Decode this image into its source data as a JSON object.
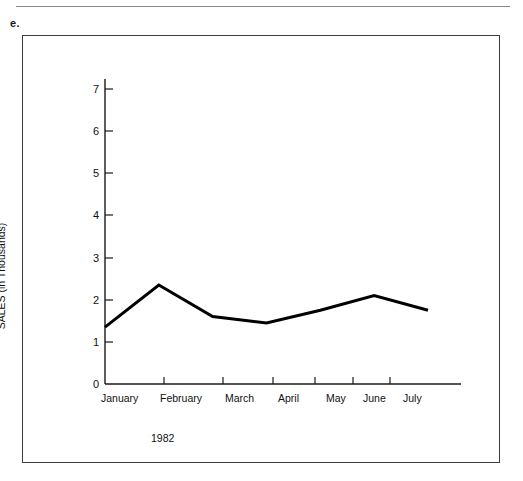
{
  "page": {
    "item_marker": "e."
  },
  "chart_data": {
    "type": "line",
    "title": "",
    "subtitle": "",
    "xlabel": "1982",
    "ylabel": "SALES (in Thousands)",
    "categories": [
      "January",
      "February",
      "March",
      "April",
      "May",
      "June",
      "July"
    ],
    "values": [
      1.35,
      2.35,
      1.6,
      1.45,
      1.75,
      2.1,
      1.75
    ],
    "series": [
      {
        "name": "Sales",
        "values": [
          1.35,
          2.35,
          1.6,
          1.45,
          1.75,
          2.1,
          1.75
        ]
      }
    ],
    "ylim": [
      0,
      7
    ],
    "xlim": [
      0,
      6
    ],
    "ytick_labels": [
      "0",
      "1",
      "2",
      "3",
      "4",
      "5",
      "6",
      "7"
    ],
    "ytick_values": [
      0,
      1,
      2,
      3,
      4,
      5,
      6,
      7
    ],
    "xtick_labels": [
      "January",
      "February",
      "March",
      "April",
      "May",
      "June",
      "July"
    ],
    "grid": false,
    "legend": false,
    "legend_position": "none",
    "line_color": "#000000",
    "axis_color": "#1a1a1a",
    "background_color": "#ffffff"
  }
}
